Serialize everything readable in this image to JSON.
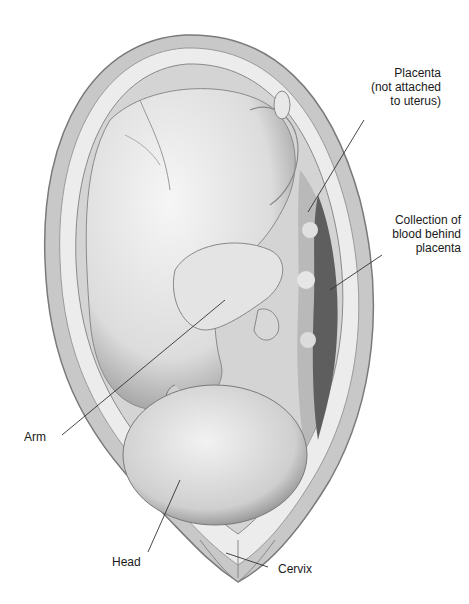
{
  "figure": {
    "labels": [
      {
        "id": "placenta",
        "text": "Placenta\n(not attached\nto uterus)"
      },
      {
        "id": "blood",
        "text": "Collection of\nblood behind\nplacenta"
      },
      {
        "id": "arm",
        "text": "Arm"
      },
      {
        "id": "head",
        "text": "Head"
      },
      {
        "id": "cervix",
        "text": "Cervix"
      }
    ]
  }
}
